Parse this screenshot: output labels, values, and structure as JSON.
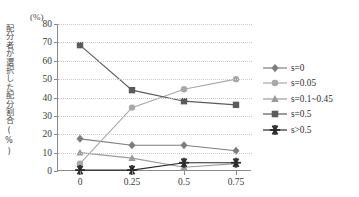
{
  "chart_data": {
    "type": "line",
    "title": "",
    "xlabel": "",
    "ylabel": "配分者が選択した配分割合(%)",
    "yunit": "(%)",
    "x": [
      0,
      0.25,
      0.5,
      0.75
    ],
    "xtick_labels": [
      "0",
      "0.25",
      "0.5",
      "0.75"
    ],
    "ytick_labels": [
      "0",
      "10",
      "20",
      "30",
      "40",
      "50",
      "60",
      "70",
      "80"
    ],
    "ylim": [
      0,
      80
    ],
    "ytick_values": [
      0,
      10,
      20,
      30,
      40,
      50,
      60,
      70,
      80
    ],
    "grid": true,
    "legend_position": "right",
    "series": [
      {
        "name": "s=0",
        "marker": "diamond",
        "color": "#7d7d7d",
        "values": [
          17.5,
          14,
          14,
          11
        ]
      },
      {
        "name": "s=0.05",
        "marker": "circle",
        "color": "#a8a8a8",
        "values": [
          4,
          34.5,
          44.5,
          50
        ]
      },
      {
        "name": "s=0.1~0.45",
        "marker": "triangle",
        "color": "#9c9c9c",
        "values": [
          10,
          7,
          2,
          4
        ]
      },
      {
        "name": "s=0.5",
        "marker": "square",
        "color": "#5a5a5a",
        "values": [
          68.5,
          44,
          38,
          36
        ]
      },
      {
        "name": "s>0.5",
        "marker": "star",
        "color": "#2a2a2a",
        "values": [
          0.5,
          0.5,
          4.5,
          4.5
        ]
      }
    ]
  },
  "legend": {
    "items": [
      {
        "label": "s=0"
      },
      {
        "label": "s=0.05"
      },
      {
        "label": "s=0.1~0.45"
      },
      {
        "label": "s=0.5"
      },
      {
        "label": "s>0.5"
      }
    ]
  }
}
